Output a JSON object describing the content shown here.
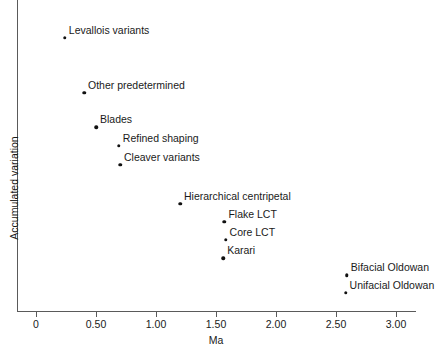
{
  "chart_data": {
    "type": "scatter",
    "title": "",
    "xlabel": "Ma",
    "ylabel": "Accumulated variation",
    "xlim": [
      -0.16,
      3.17
    ],
    "ylim": [
      0,
      1
    ],
    "grid": false,
    "legend": false,
    "xticks": [
      0,
      0.5,
      1.0,
      1.5,
      2.0,
      2.5,
      3.0
    ],
    "xticklabels": [
      "0",
      "0.50",
      "1.00",
      "1.50",
      "2.00",
      "2.50",
      "3.00"
    ],
    "yticks": [],
    "yticklabels": [],
    "point_color": "#111111",
    "axis_color": "#5a5a5a",
    "points": [
      {
        "label": "Levallois variants",
        "x": 0.24,
        "y": 0.9
      },
      {
        "label": "Other predetermined",
        "x": 0.4,
        "y": 0.714
      },
      {
        "label": "Blades",
        "x": 0.5,
        "y": 0.598
      },
      {
        "label": "Refined shaping",
        "x": 0.69,
        "y": 0.537
      },
      {
        "label": "Cleaver variants",
        "x": 0.7,
        "y": 0.473
      },
      {
        "label": "Hierarchical centripetal",
        "x": 1.2,
        "y": 0.341
      },
      {
        "label": "Flake LCT",
        "x": 1.57,
        "y": 0.28
      },
      {
        "label": "Core LCT",
        "x": 1.58,
        "y": 0.219
      },
      {
        "label": "Karari",
        "x": 1.56,
        "y": 0.158
      },
      {
        "label": "Bifacial Oldowan",
        "x": 2.59,
        "y": 0.1
      },
      {
        "label": "Unifacial Oldowan",
        "x": 2.58,
        "y": 0.042
      }
    ]
  }
}
